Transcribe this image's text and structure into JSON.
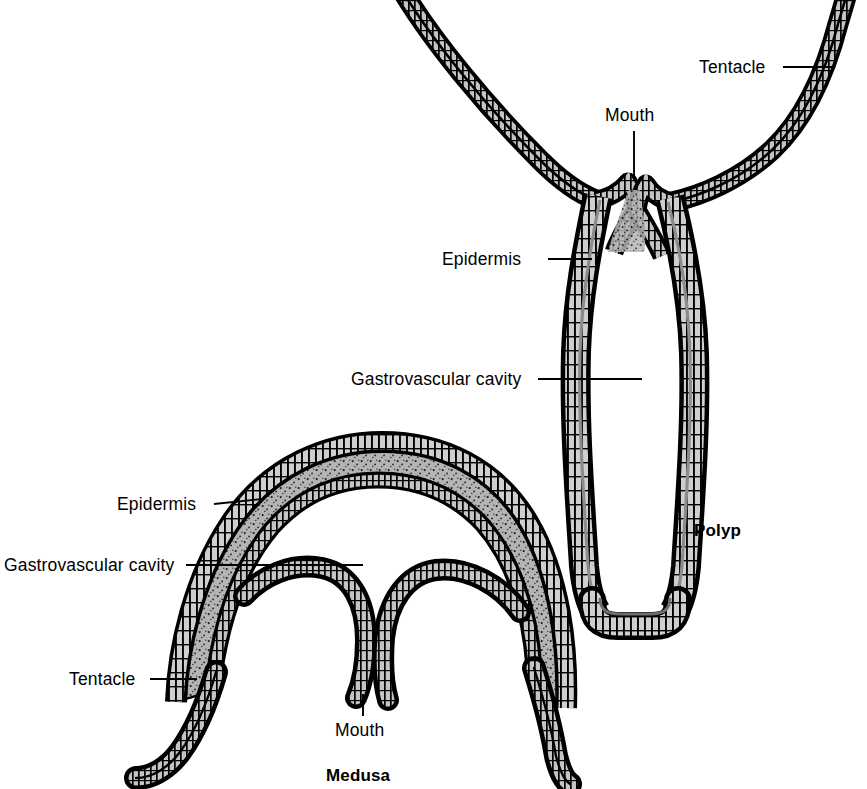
{
  "page": {
    "width": 867,
    "height": 789,
    "background": "#ffffff"
  },
  "body_text": {
    "name": "book-body-text",
    "content": "eir cells; the less\ny are. Thus, the\nbeing the same\nuth, the perfect\nh would be on\nble to animals is\ntop and bottom\np). And, in fact,\nf animals whose\nese animals are\na prickly plant,\nntacles)."
  },
  "figure": {
    "caption_polyp": "Polyp",
    "caption_medusa": "Medusa",
    "ink_color": "#000000",
    "mesoglea_color": "#b0b0b0",
    "cell_fill_color": "#c8c8c8",
    "polyp": {
      "name": "polyp-diagram",
      "labels": [
        {
          "id": "polyp-tentacle",
          "text": "Tentacle"
        },
        {
          "id": "polyp-mouth",
          "text": "Mouth"
        },
        {
          "id": "polyp-epidermis",
          "text": "Epidermis"
        },
        {
          "id": "polyp-gastrovascular-cavity",
          "text": "Gastrovascular cavity"
        }
      ],
      "caption": "Polyp"
    },
    "medusa": {
      "name": "medusa-diagram",
      "labels": [
        {
          "id": "medusa-epidermis",
          "text": "Epidermis"
        },
        {
          "id": "medusa-gastrovascular-cavity",
          "text": "Gastrovascular cavity"
        },
        {
          "id": "medusa-tentacle",
          "text": "Tentacle"
        },
        {
          "id": "medusa-mouth",
          "text": "Mouth"
        }
      ],
      "caption": "Medusa"
    }
  }
}
